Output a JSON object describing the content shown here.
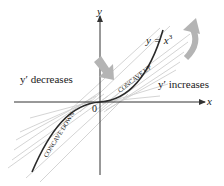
{
  "diagram": {
    "function_label": "y = x",
    "function_exponent": "3",
    "axis_x_label": "x",
    "axis_y_label": "y",
    "origin_label": "0",
    "left_annotation": "y′ decreases",
    "right_annotation": "y′ increases",
    "concave_up_label": "CONCAVE UP",
    "concave_down_label": "CONCAVE DOWN",
    "colors": {
      "curve": "#2a2a2a",
      "axes": "#333333",
      "tangents": "#c8c8c8",
      "arrows": "#b4b4b4",
      "text": "#1a1a1a"
    }
  }
}
